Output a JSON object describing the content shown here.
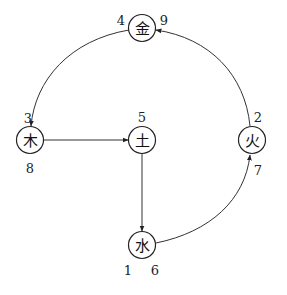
{
  "diagram": {
    "type": "five-elements-cycle",
    "nodes": [
      {
        "id": "metal",
        "label": "金",
        "x": 142,
        "y": 28,
        "numbers": [
          {
            "text": "4",
            "x": 121,
            "y": 20
          },
          {
            "text": "9",
            "x": 164,
            "y": 20
          }
        ]
      },
      {
        "id": "wood",
        "label": "木",
        "x": 30,
        "y": 140,
        "numbers": [
          {
            "text": "3",
            "x": 28,
            "y": 118
          },
          {
            "text": "8",
            "x": 30,
            "y": 168
          }
        ]
      },
      {
        "id": "earth",
        "label": "土",
        "x": 142,
        "y": 140,
        "numbers": [
          {
            "text": "5",
            "x": 142,
            "y": 117
          }
        ]
      },
      {
        "id": "fire",
        "label": "火",
        "x": 252,
        "y": 140,
        "numbers": [
          {
            "text": "2",
            "x": 258,
            "y": 117
          },
          {
            "text": "7",
            "x": 258,
            "y": 170
          }
        ]
      },
      {
        "id": "water",
        "label": "水",
        "x": 142,
        "y": 245,
        "numbers": [
          {
            "text": "1",
            "x": 128,
            "y": 270
          },
          {
            "text": "6",
            "x": 155,
            "y": 270
          }
        ]
      }
    ],
    "edges": [
      {
        "from": "metal",
        "to": "wood",
        "style": "curve"
      },
      {
        "from": "wood",
        "to": "earth",
        "style": "straight"
      },
      {
        "from": "earth",
        "to": "water",
        "style": "straight"
      },
      {
        "from": "water",
        "to": "fire",
        "style": "curve"
      },
      {
        "from": "fire",
        "to": "metal",
        "style": "curve"
      }
    ]
  }
}
